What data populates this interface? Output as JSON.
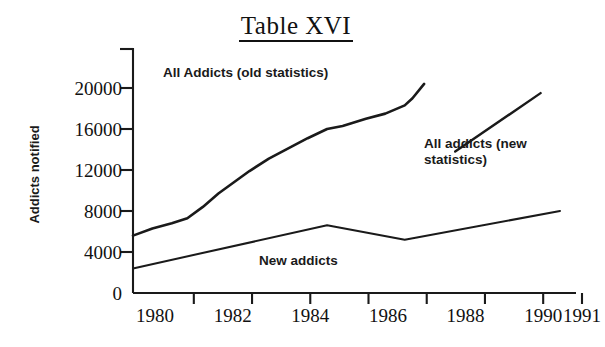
{
  "title": "Table XVI",
  "annotations": {
    "old_series": "All Addicts (old statistics)",
    "new_series": "All addicts (new\nstatistics)",
    "new_addicts": "New addicts"
  },
  "chart_data": {
    "type": "line",
    "title": "Table XVI",
    "xlabel": "",
    "ylabel": "Addicts notified",
    "xlim": [
      1980,
      1991
    ],
    "ylim": [
      0,
      22000
    ],
    "grid": false,
    "legend": "inline-annotations",
    "xticklabels": [
      "1980",
      "1982",
      "1984",
      "1986",
      "1988",
      "1990",
      "1991"
    ],
    "xtickvalues": [
      1980,
      1982,
      1984,
      1986,
      1988,
      1990,
      1991
    ],
    "yticklabels": [
      "0",
      "4000",
      "8000",
      "12000",
      "16000",
      "20000"
    ],
    "ytickvalues": [
      0,
      4000,
      8000,
      12000,
      16000,
      20000
    ],
    "series": [
      {
        "name": "All Addicts (old statistics)",
        "color": "#1a1a1a",
        "x": [
          1980.0,
          1980.5,
          1981.0,
          1981.4,
          1981.8,
          1982.2,
          1982.6,
          1983.0,
          1983.5,
          1984.0,
          1984.5,
          1985.0,
          1985.4,
          1986.0,
          1986.5,
          1987.0,
          1987.2,
          1987.5
        ],
        "values": [
          5600,
          6300,
          6800,
          7300,
          8400,
          9700,
          10800,
          11900,
          13100,
          14100,
          15100,
          16000,
          16300,
          17000,
          17500,
          18300,
          19000,
          20400
        ]
      },
      {
        "name": "New addicts",
        "color": "#1a1a1a",
        "x": [
          1980,
          1985,
          1987,
          1991
        ],
        "values": [
          2400,
          6600,
          5200,
          8000
        ]
      },
      {
        "name": "All addicts (new statistics)",
        "color": "#1a1a1a",
        "x": [
          1988.3,
          1990.5
        ],
        "values": [
          13800,
          19500
        ]
      }
    ]
  }
}
